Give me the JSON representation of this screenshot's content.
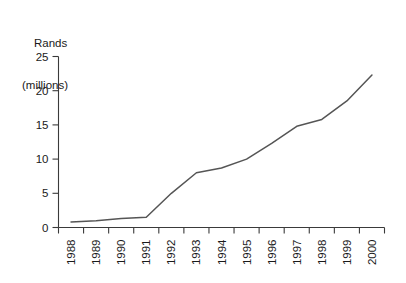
{
  "chart_data": {
    "type": "line",
    "title": "",
    "ylabel_line_1": "Rands",
    "ylabel_line_2": "(millions)",
    "ylabel": "Rands (millions)",
    "xlabel": "",
    "ylim": [
      0,
      25
    ],
    "yticks": [
      0,
      5,
      10,
      15,
      20,
      25
    ],
    "ytick_labels": [
      "0",
      "5",
      "10",
      "15",
      "20",
      "25"
    ],
    "grid": false,
    "legend": "none",
    "categories": [
      "1988",
      "1989",
      "1990",
      "1991",
      "1992",
      "1993",
      "1994",
      "1995",
      "1996",
      "1997",
      "1998",
      "1999",
      "2000"
    ],
    "values": [
      0.8,
      1.0,
      1.3,
      1.5,
      5.0,
      8.0,
      8.7,
      10.0,
      12.3,
      14.8,
      15.8,
      18.5,
      22.3
    ],
    "series": [
      {
        "name": "Rands (millions)",
        "values": [
          0.8,
          1.0,
          1.3,
          1.5,
          5.0,
          8.0,
          8.7,
          10.0,
          12.3,
          14.8,
          15.8,
          18.5,
          22.3
        ]
      }
    ],
    "line_color": "#555555",
    "axis_color": "#3a3a3a",
    "background_color": "#ffffff",
    "xtick_label_rotation": -90
  }
}
